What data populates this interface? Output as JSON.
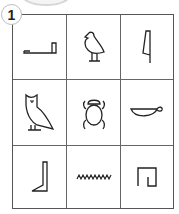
{
  "exercise": {
    "number": "1",
    "grid": {
      "rows": 3,
      "cols": 3,
      "cells": [
        {
          "row": 1,
          "col": 1,
          "glyph": "tethering-rope-icon"
        },
        {
          "row": 1,
          "col": 2,
          "glyph": "quail-chick-icon"
        },
        {
          "row": 1,
          "col": 3,
          "glyph": "reed-leaf-icon"
        },
        {
          "row": 2,
          "col": 1,
          "glyph": "owl-icon"
        },
        {
          "row": 2,
          "col": 2,
          "glyph": "scarab-beetle-icon"
        },
        {
          "row": 2,
          "col": 3,
          "glyph": "basket-with-handle-icon"
        },
        {
          "row": 3,
          "col": 1,
          "glyph": "foot-leg-icon"
        },
        {
          "row": 3,
          "col": 2,
          "glyph": "water-ripple-icon"
        },
        {
          "row": 3,
          "col": 3,
          "glyph": "reed-shelter-icon"
        }
      ]
    }
  },
  "colors": {
    "line": "#555555",
    "glyph": "#222222",
    "badge_border": "#bbbbbb"
  }
}
